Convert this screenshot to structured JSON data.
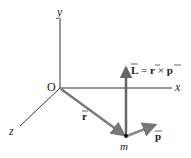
{
  "diagram": {
    "axes": {
      "x_label": "x",
      "y_label": "y",
      "z_label": "z",
      "origin_label": "O"
    },
    "vectors": {
      "r_label": "r",
      "p_label": "p",
      "L_equation": {
        "L": "L",
        "eq": " = ",
        "r": "r",
        "times": " × ",
        "p": "p"
      }
    },
    "particle_label": "m",
    "colors": {
      "axis": "#333333",
      "vector": "#7a7a7a",
      "vector_dark": "#666666"
    }
  }
}
